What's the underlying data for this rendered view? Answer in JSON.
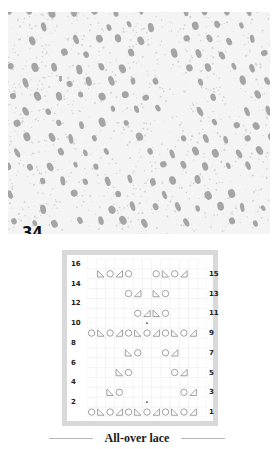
{
  "swatch": {
    "pattern_number": "34",
    "description": "knitted lace swatch photo"
  },
  "chart": {
    "stitches": 13,
    "rows": 16,
    "left_row_numbers": [
      "16",
      "14",
      "12",
      "10",
      "8",
      "6",
      "4",
      "2"
    ],
    "right_row_numbers": [
      "15",
      "13",
      "11",
      "9",
      "7",
      "5",
      "3",
      "1"
    ],
    "symbols_legend": {
      "O": "yarn-over",
      "R": "right-slant-decrease (◿)",
      "L": "left-slant-decrease (◺)",
      "dot": "center-marker"
    },
    "rows_data": [
      {
        "row": 15,
        "cells": {
          "2": "L",
          "3": "O",
          "4": "R",
          "5": "O",
          "8": "O",
          "9": "L",
          "10": "O",
          "11": "R"
        }
      },
      {
        "row": 13,
        "cells": {
          "5": "O",
          "6": "R",
          "8": "L",
          "9": "O"
        }
      },
      {
        "row": 11,
        "cells": {
          "6": "O",
          "7": "R",
          "8": "L",
          "9": "O"
        }
      },
      {
        "row": 10,
        "cells": {
          "7": "dot"
        }
      },
      {
        "row": 9,
        "cells": {
          "1": "O",
          "2": "L",
          "3": "O",
          "4": "R",
          "5": "O",
          "6": "L",
          "7": "O",
          "8": "R",
          "9": "O",
          "10": "L",
          "11": "O",
          "12": "R"
        }
      },
      {
        "row": 7,
        "cells": {
          "5": "L",
          "6": "O",
          "9": "O",
          "10": "R"
        }
      },
      {
        "row": 5,
        "cells": {
          "4": "L",
          "5": "O",
          "10": "O",
          "11": "R"
        }
      },
      {
        "row": 3,
        "cells": {
          "3": "L",
          "4": "O",
          "11": "O",
          "12": "R"
        }
      },
      {
        "row": 2,
        "cells": {
          "7": "dot"
        }
      },
      {
        "row": 1,
        "cells": {
          "1": "O",
          "2": "L",
          "3": "O",
          "4": "R",
          "5": "O",
          "6": "L",
          "7": "O",
          "8": "R",
          "9": "O",
          "10": "L",
          "11": "O",
          "12": "R"
        }
      }
    ]
  },
  "caption": {
    "title": "All-over lace"
  },
  "colors": {
    "frame": "#d9d9d9",
    "grid_line": "#ececec",
    "symbol": "#8a8a8a",
    "text": "#1a1a1a"
  }
}
